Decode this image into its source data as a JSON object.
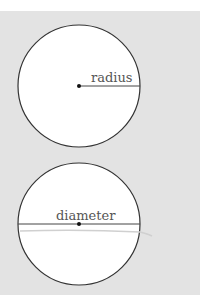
{
  "diagram": {
    "colors": {
      "background": "#e3e3e3",
      "circle_fill": "#ffffff",
      "stroke": "#333333",
      "label": "#555555"
    },
    "figures": [
      {
        "name": "radius-figure",
        "label": "radius",
        "center": [
          79,
          86
        ],
        "r": 61
      },
      {
        "name": "diameter-figure",
        "label": "diameter",
        "center": [
          79,
          224
        ],
        "r": 61
      }
    ]
  }
}
